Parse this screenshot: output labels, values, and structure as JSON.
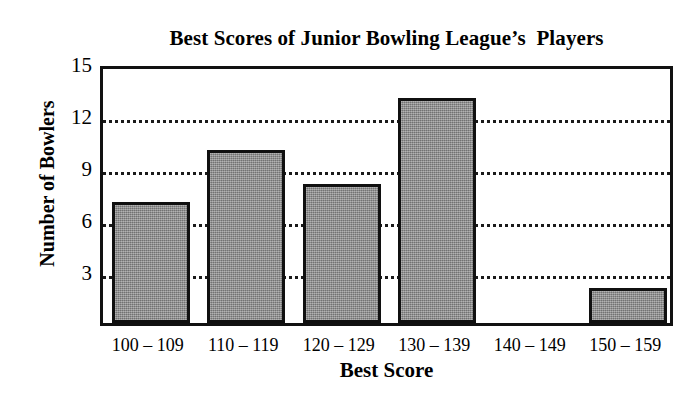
{
  "chart_data": {
    "type": "bar",
    "title": "Best Scores of Junior Bowling League’s  Players",
    "xlabel": "Best Score",
    "ylabel": "Number of Bowlers",
    "categories": [
      "100 – 109",
      "110 – 119",
      "120 – 129",
      "130 – 139",
      "140 – 149",
      "150 – 159"
    ],
    "values": [
      7,
      10,
      8,
      13,
      0,
      2
    ],
    "ylim": [
      0,
      15
    ],
    "yticks": [
      3,
      6,
      9,
      12,
      15
    ],
    "ytick_labels": [
      "3",
      "6",
      "9",
      "12",
      "15"
    ],
    "grid": "horizontal-dotted",
    "legend": "none",
    "bar_fill_color": "#8a8a8a",
    "bar_edge_color": "#101010",
    "axis_color": "#111111",
    "background_color": "#ffffff"
  }
}
